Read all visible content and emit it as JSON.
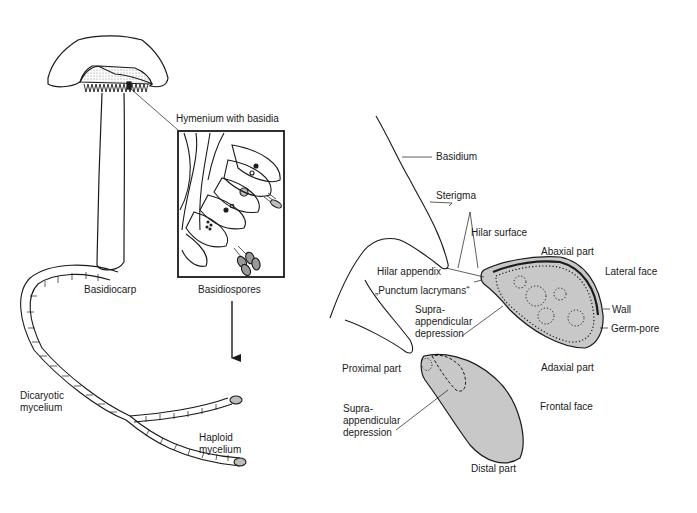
{
  "figure": {
    "left_panel": {
      "labels": {
        "hymenium": "Hymenium with basidia",
        "basidiocarp": "Basidiocarp",
        "basidiospores": "Basidiospores",
        "dicaryotic_l1": "Dicaryotic",
        "dicaryotic_l2": "mycelium",
        "haploid_l1": "Haploid",
        "haploid_l2": "mycelium"
      }
    },
    "right_panel": {
      "labels": {
        "basidium": "Basidium",
        "sterigma": "Sterigma",
        "hilar_surface": "Hilar surface",
        "abaxial_part": "Abaxial part",
        "lateral_face": "Lateral face",
        "hilar_appendix": "Hilar appendix",
        "punctum": "„Punctum lacrymans“",
        "supra1_l1": "Supra-",
        "supra1_l2": "appendicular",
        "supra1_l3": "depression",
        "wall": "Wall",
        "germ_pore": "Germ-pore",
        "proximal_part": "Proximal part",
        "adaxial_part": "Adaxial part",
        "supra2_l1": "Supra-",
        "supra2_l2": "appendicular",
        "supra2_l3": "depression",
        "frontal_face": "Frontal face",
        "distal_part": "Distal part"
      }
    },
    "colors": {
      "ink": "#1a1a1a",
      "spore_fill": "#c8c8c8",
      "stipple": "#bdbdbd"
    }
  }
}
